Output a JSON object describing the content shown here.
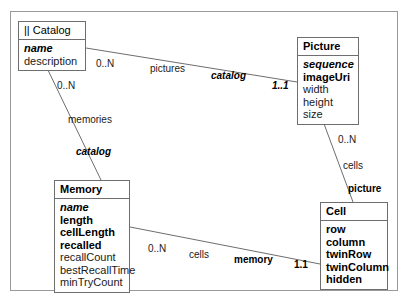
{
  "diagram": {
    "type": "uml-class-diagram",
    "background": "#ffffff",
    "line_color": "#6e6e6e",
    "frame_color": "#9a9a9a"
  },
  "entities": {
    "catalog": {
      "title": "|| Catalog",
      "attributes": [
        {
          "name": "name",
          "style": "key"
        },
        {
          "name": "description",
          "style": "plain"
        }
      ]
    },
    "picture": {
      "title": "Picture",
      "attributes": [
        {
          "name": "sequence",
          "style": "key"
        },
        {
          "name": "imageUri",
          "style": "req"
        },
        {
          "name": "width",
          "style": "plain"
        },
        {
          "name": "height",
          "style": "plain"
        },
        {
          "name": "size",
          "style": "plain"
        }
      ]
    },
    "memory": {
      "title": "Memory",
      "attributes": [
        {
          "name": "name",
          "style": "key"
        },
        {
          "name": "length",
          "style": "req"
        },
        {
          "name": "cellLength",
          "style": "req"
        },
        {
          "name": "recalled",
          "style": "req"
        },
        {
          "name": "recallCount",
          "style": "plain"
        },
        {
          "name": "bestRecallTime",
          "style": "plain"
        },
        {
          "name": "minTryCount",
          "style": "plain"
        }
      ]
    },
    "cell": {
      "title": "Cell",
      "attributes": [
        {
          "name": "row",
          "style": "req"
        },
        {
          "name": "column",
          "style": "req"
        },
        {
          "name": "twinRow",
          "style": "req"
        },
        {
          "name": "twinColumn",
          "style": "req"
        },
        {
          "name": "hidden",
          "style": "req"
        }
      ]
    }
  },
  "associations": {
    "catalog_pictures": {
      "source_cardinality": "0..N",
      "source_role": "pictures",
      "target_role": "catalog",
      "target_cardinality": "1..1"
    },
    "catalog_memories": {
      "source_cardinality": "0..N",
      "source_role": "memories",
      "target_role": "catalog"
    },
    "picture_cells": {
      "source_cardinality": "0..N",
      "source_role": "cells",
      "target_role": "picture"
    },
    "memory_cells": {
      "source_cardinality": "0..N",
      "source_role": "cells",
      "target_role": "memory",
      "target_cardinality": "1.1"
    }
  }
}
